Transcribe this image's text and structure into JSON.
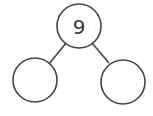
{
  "diagram": {
    "type": "number-bond",
    "stroke_color": "#444444",
    "background": "#ffffff",
    "whole": {
      "label": "9",
      "cx": 79,
      "cy": 26,
      "r": 22
    },
    "parts": [
      {
        "label": "",
        "cx": 35,
        "cy": 80,
        "r": 22
      },
      {
        "label": "",
        "cx": 123,
        "cy": 82,
        "r": 22
      }
    ],
    "connectors": [
      {
        "x1": 66,
        "y1": 43,
        "x2": 49,
        "y2": 64
      },
      {
        "x1": 92,
        "y1": 43,
        "x2": 109,
        "y2": 63
      }
    ]
  }
}
